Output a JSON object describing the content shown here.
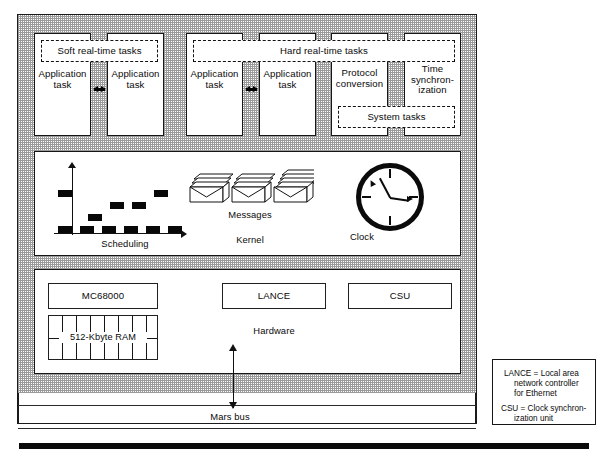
{
  "diagram": {
    "colors": {
      "ink": "#111111",
      "paper": "#ffffff",
      "stipple": "#9a9a9a"
    }
  },
  "task_layer": {
    "soft_group_label": "Soft real-time tasks",
    "hard_group_label": "Hard real-time tasks",
    "system_group_label": "System tasks",
    "soft_tasks": [
      {
        "label": "Application\ntask"
      },
      {
        "label": "Application\ntask"
      }
    ],
    "hard_tasks": [
      {
        "label": "Application\ntask"
      },
      {
        "label": "Application\ntask"
      },
      {
        "label": "Protocol\nconversion"
      },
      {
        "label": "Time\nsynchron-\nization"
      }
    ],
    "ellipsis_glyph": "double-arrow"
  },
  "kernel_layer": {
    "label": "Kernel",
    "scheduling_label": "Scheduling",
    "messages_label": "Messages",
    "clock_label": "Clock",
    "message_stacks": 3,
    "clock": {
      "hour_hand": "11",
      "minute_hand": "3",
      "tick_count": 4
    }
  },
  "chart_data": {
    "type": "bar",
    "title": "Scheduling",
    "xlabel": "",
    "ylabel": "",
    "grid": false,
    "categories": [
      "t1",
      "t2",
      "t3",
      "t4",
      "t5",
      "t6",
      "t7"
    ],
    "note": "Gantt-style scheduling trace: black blocks at task levels over time",
    "blocks": [
      {
        "x": 0,
        "y": 3,
        "w": 14,
        "h": 7
      },
      {
        "x": 0,
        "y": 0,
        "w": 14,
        "h": 7
      },
      {
        "x": 22,
        "y": 0,
        "w": 14,
        "h": 7
      },
      {
        "x": 30,
        "y": 1,
        "w": 14,
        "h": 7
      },
      {
        "x": 44,
        "y": 0,
        "w": 14,
        "h": 7
      },
      {
        "x": 52,
        "y": 2,
        "w": 14,
        "h": 7
      },
      {
        "x": 66,
        "y": 0,
        "w": 14,
        "h": 7
      },
      {
        "x": 74,
        "y": 2,
        "w": 14,
        "h": 7
      },
      {
        "x": 88,
        "y": 0,
        "w": 14,
        "h": 7
      },
      {
        "x": 96,
        "y": 3,
        "w": 14,
        "h": 7
      },
      {
        "x": 110,
        "y": 0,
        "w": 14,
        "h": 7
      }
    ]
  },
  "hardware_layer": {
    "label": "Hardware",
    "components": [
      {
        "name": "cpu",
        "label": "MC68000"
      },
      {
        "name": "lance",
        "label": "LANCE"
      },
      {
        "name": "csu",
        "label": "CSU"
      }
    ],
    "memory": {
      "label": "512-Kbyte RAM",
      "pins": 7
    }
  },
  "bus": {
    "label": "Mars bus"
  },
  "legend": {
    "entries": [
      {
        "line1": "LANCE = Local area",
        "line2": "network controller",
        "line3": "for Ethernet"
      },
      {
        "line1": "CSU = Clock synchron-",
        "line2": "ization unit",
        "line3": ""
      }
    ],
    "lance_l1": "LANCE = Local area",
    "lance_l2": "network controller",
    "lance_l3": "for Ethernet",
    "csu_l1": "CSU = Clock synchron-",
    "csu_l2": "ization unit"
  }
}
